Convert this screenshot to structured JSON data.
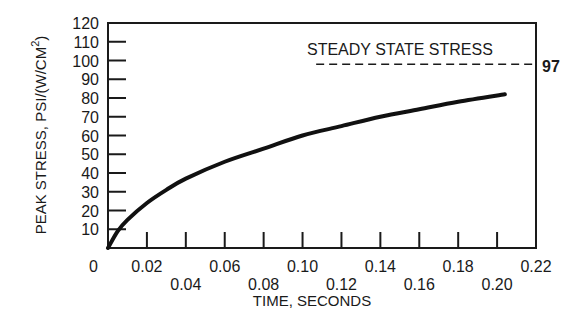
{
  "chart_data": {
    "type": "line",
    "title": "",
    "xlabel": "TIME, SECONDS",
    "ylabel": "PEAK STRESS, PSI/(W/CM²)",
    "ylabel_main": "PEAK STRESS, PSI/(W/CM",
    "ylabel_sup": "2",
    "ylabel_close": ")",
    "xlim": [
      0,
      0.22
    ],
    "ylim": [
      0,
      120
    ],
    "grid": false,
    "legend": null,
    "x_ticks": [
      "0",
      "0.02",
      "0.04",
      "0.06",
      "0.08",
      "0.10",
      "0.12",
      "0.14",
      "0.16",
      "0.18",
      "0.20",
      "0.22"
    ],
    "y_ticks": [
      "0",
      "10",
      "20",
      "30",
      "40",
      "50",
      "60",
      "70",
      "80",
      "90",
      "100",
      "110",
      "120"
    ],
    "series": [
      {
        "name": "Peak stress",
        "x": [
          0,
          0.005,
          0.01,
          0.02,
          0.03,
          0.04,
          0.06,
          0.08,
          0.1,
          0.12,
          0.14,
          0.16,
          0.18,
          0.204
        ],
        "values": [
          0,
          9,
          15,
          24,
          31,
          37,
          46,
          53,
          60,
          65,
          70,
          74,
          78,
          82
        ]
      }
    ],
    "reference_lines": [
      {
        "label": "STEADY STATE STRESS",
        "value": 97,
        "value_label": "97",
        "style": "dashed",
        "x_start": 0.107,
        "x_end": 0.22
      }
    ]
  }
}
